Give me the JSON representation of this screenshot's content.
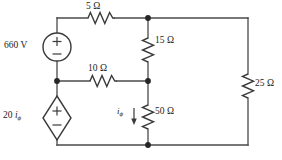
{
  "figure": {
    "type": "electrical-circuit-schematic",
    "width": 282,
    "height": 160,
    "background_color": "#ffffff",
    "line_color": "#4a4a4a"
  },
  "labels": {
    "r5": "5 Ω",
    "r10": "10 Ω",
    "r15": "15 Ω",
    "r50": "50 Ω",
    "r25": "25 Ω",
    "voltage_source": "660 V",
    "dependent_source_prefix": "20 ",
    "dependent_source_var": "i",
    "dependent_source_sub": "ϕ",
    "current_var": "i",
    "current_sub": "ϕ",
    "plus_sign": "+",
    "minus_sign": "−"
  },
  "components": [
    {
      "id": "vsrc-660",
      "kind": "independent-voltage-source",
      "shape": "circle",
      "label": "660 V",
      "value": 660,
      "unit": "V",
      "polarity_top": "+",
      "polarity_bottom": "−",
      "branch": "left",
      "center": [
        57,
        47
      ]
    },
    {
      "id": "res-5",
      "kind": "resistor",
      "label": "5 Ω",
      "value": 5,
      "unit": "Ω",
      "orientation": "horizontal",
      "branch": "top",
      "between_nodes": [
        "top-left-corner",
        "node-top-middle"
      ],
      "center": [
        101,
        18
      ]
    },
    {
      "id": "res-10",
      "kind": "resistor",
      "label": "10 Ω",
      "value": 10,
      "unit": "Ω",
      "orientation": "horizontal",
      "branch": "middle-horizontal",
      "between_nodes": [
        "node-left-middle",
        "node-center-middle"
      ],
      "center": [
        103,
        81
      ]
    },
    {
      "id": "res-15",
      "kind": "resistor",
      "label": "15 Ω",
      "value": 15,
      "unit": "Ω",
      "orientation": "vertical",
      "branch": "center",
      "between_nodes": [
        "node-top-middle",
        "node-center-middle"
      ],
      "center": [
        148,
        50
      ]
    },
    {
      "id": "res-50",
      "kind": "resistor",
      "label": "50 Ω",
      "value": 50,
      "unit": "Ω",
      "orientation": "vertical",
      "branch": "center",
      "between_nodes": [
        "node-center-middle",
        "node-bottom-middle"
      ],
      "center": [
        148,
        117
      ],
      "current_label": "iϕ",
      "current_direction": "down"
    },
    {
      "id": "res-25",
      "kind": "resistor",
      "label": "25 Ω",
      "value": 25,
      "unit": "Ω",
      "orientation": "vertical",
      "branch": "right",
      "between_nodes": [
        "top-right-corner",
        "bottom-right-corner"
      ],
      "center": [
        248,
        86
      ]
    },
    {
      "id": "dep-src-20iphi",
      "kind": "dependent-voltage-source",
      "shape": "diamond",
      "label": "20 iϕ",
      "gain": 20,
      "control_variable": "iϕ",
      "polarity_top": "+",
      "polarity_bottom": "−",
      "branch": "left-lower",
      "center": [
        57,
        118
      ]
    }
  ],
  "nodes": [
    {
      "id": "node-top-middle",
      "x": 148,
      "y": 18,
      "dot": true
    },
    {
      "id": "node-left-middle",
      "x": 57,
      "y": 81,
      "dot": true
    },
    {
      "id": "node-center-middle",
      "x": 148,
      "y": 81,
      "dot": true
    },
    {
      "id": "node-bottom-middle",
      "x": 148,
      "y": 145,
      "dot": true
    }
  ]
}
